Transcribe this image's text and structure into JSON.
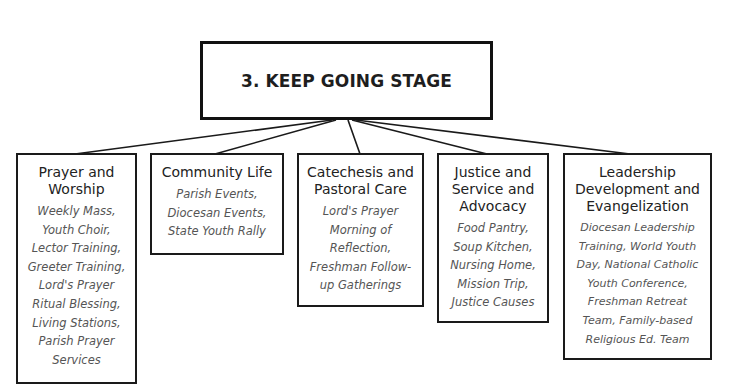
{
  "diagram": {
    "root": {
      "title": "3. KEEP GOING STAGE"
    },
    "categories": [
      {
        "title": "Prayer and\nWorship",
        "items": "Weekly Mass,\nYouth Choir,\nLector Training,\nGreeter Training,\nLord's Prayer\nRitual Blessing,\nLiving Stations,\nParish Prayer\nServices"
      },
      {
        "title": "Community Life",
        "items": "Parish Events,\nDiocesan Events,\nState Youth Rally"
      },
      {
        "title": "Catechesis and\nPastoral Care",
        "items": "Lord's Prayer\nMorning of\nReflection,\nFreshman Follow-\nup Gatherings"
      },
      {
        "title": "Justice and\nService and\nAdvocacy",
        "items": "Food Pantry,\nSoup Kitchen,\nNursing Home,\nMission Trip,\nJustice Causes"
      },
      {
        "title": "Leadership\nDevelopment and\nEvangelization",
        "items": "Diocesan Leadership\nTraining, World Youth\nDay, National Catholic\nYouth Conference,\nFreshman Retreat\nTeam, Family-based\nReligious Ed. Team"
      }
    ]
  }
}
